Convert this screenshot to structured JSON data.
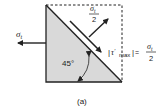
{
  "diagram": {
    "type": "stress-element",
    "caption": "(a)",
    "angle_label": "45°",
    "left_stress": {
      "symbol": "σ",
      "sub": "t"
    },
    "normal_stress": {
      "num_symbol": "σ",
      "num_sub": "t",
      "den": "2"
    },
    "shear_stress": {
      "lhs_symbol": "τ",
      "lhs_prime": "'",
      "lhs_sub": "max",
      "equals": "=",
      "num_symbol": "σ",
      "num_sub": "t",
      "den": "2"
    },
    "colors": {
      "fill": "#d9d9d9",
      "stroke": "#222222"
    }
  }
}
